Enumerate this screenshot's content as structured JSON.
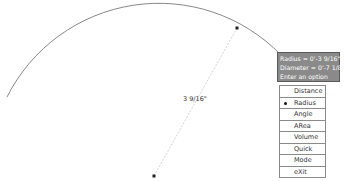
{
  "drawing": {
    "dimension_label": "3 9/16\"",
    "arc_color": "#7a7a7a"
  },
  "tooltip": {
    "lines": [
      "Radius = 0'-3 9/16\"",
      "Diameter = 0'-7 1/8\"",
      "Enter an option"
    ]
  },
  "menu": {
    "items": [
      {
        "label": "Distance",
        "selected": false
      },
      {
        "label": "Radius",
        "selected": true
      },
      {
        "label": "Angle",
        "selected": false
      },
      {
        "label": "ARea",
        "selected": false
      },
      {
        "label": "Volume",
        "selected": false
      },
      {
        "label": "Quick",
        "selected": false
      },
      {
        "label": "Mode",
        "selected": false
      },
      {
        "label": "eXit",
        "selected": false
      }
    ]
  }
}
